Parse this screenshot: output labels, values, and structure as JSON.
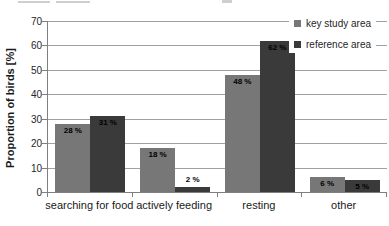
{
  "chart_data": {
    "type": "bar",
    "title": "",
    "categories": [
      "searching for food",
      "actively feeding",
      "resting",
      "other"
    ],
    "series": [
      {
        "name": "key study area",
        "color": "#777777",
        "values": [
          28,
          18,
          48,
          6
        ]
      },
      {
        "name": "reference area",
        "color": "#3a3a3a",
        "values": [
          31,
          2,
          62,
          5
        ]
      }
    ],
    "value_label_suffix": " %",
    "xlabel": "",
    "ylabel": "Proportion of birds [%]",
    "ylim": [
      0,
      70
    ],
    "yticks": [
      0,
      10,
      20,
      30,
      40,
      50,
      60,
      70
    ],
    "grid": true,
    "legend_position": "top-right",
    "colors": {
      "gridline": "#a0a0a0",
      "axis": "#7f7f7f",
      "label_text": "#000000",
      "background": "#ffffff"
    }
  }
}
